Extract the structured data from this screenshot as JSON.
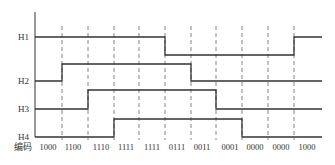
{
  "signals": [
    {
      "name": "H1",
      "label_y": 37
    },
    {
      "name": "H2",
      "label_y": 81
    },
    {
      "name": "H3",
      "label_y": 109
    },
    {
      "name": "H4",
      "label_y": 137
    }
  ],
  "code_label": "编码",
  "codes": [
    "1000",
    "1100",
    "1110",
    "1111",
    "1111",
    "0111",
    "0011",
    "0001",
    "0000",
    "0000",
    "1000"
  ],
  "colors": {
    "line": "#333333",
    "dash": "#666666"
  }
}
